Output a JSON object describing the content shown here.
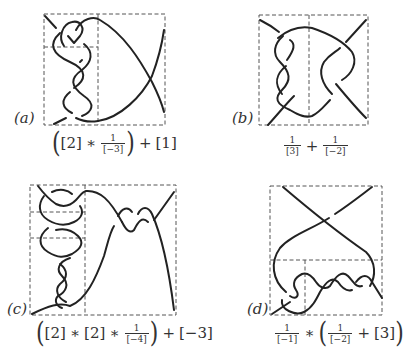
{
  "panels": [
    {
      "id": "a",
      "label": "(a)",
      "formula": {
        "open": "(",
        "t1": "[2]",
        "op1": "∗",
        "frac1_num": "1",
        "frac1_den": "[−3]",
        "close": ")",
        "op2": "+",
        "t2": "[1]"
      }
    },
    {
      "id": "b",
      "label": "(b)",
      "formula": {
        "frac1_num": "1",
        "frac1_den": "[3]",
        "op1": "+",
        "frac2_num": "1",
        "frac2_den": "[−2]"
      }
    },
    {
      "id": "c",
      "label": "(c)",
      "formula": {
        "open": "(",
        "t1": "[2]",
        "op1": "∗",
        "t2": "[2]",
        "op2": "∗",
        "frac1_num": "1",
        "frac1_den": "[−4]",
        "close": ")",
        "op3": "+",
        "t3": "[−3]"
      }
    },
    {
      "id": "d",
      "label": "(d)",
      "formula": {
        "frac1_num": "1",
        "frac1_den": "[−1]",
        "op1": "∗",
        "open": "(",
        "frac2_num": "1",
        "frac2_den": "[−2]",
        "op2": "+",
        "t1": "[3]",
        "close": ")"
      }
    }
  ],
  "colors": {
    "strand": "#222222",
    "dashed_box": "#555555",
    "background": "#ffffff"
  }
}
